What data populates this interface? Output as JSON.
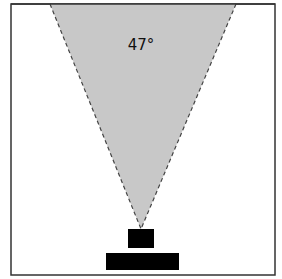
{
  "diagram": {
    "angle_label": "47°",
    "colors": {
      "frame": "#333333",
      "cone_fill": "#c8c8c8",
      "cone_edge": "#444444",
      "blocks": "#000000",
      "background": "#ffffff"
    },
    "frame": {
      "x": 11,
      "y": 4,
      "width": 264,
      "height": 271
    },
    "cone": {
      "top_left": [
        50,
        4
      ],
      "top_right": [
        236,
        4
      ],
      "apex": [
        141,
        229
      ]
    },
    "blocks": [
      {
        "name": "upper-block",
        "x": 128,
        "y": 229,
        "width": 26,
        "height": 19
      },
      {
        "name": "base-block",
        "x": 106,
        "y": 253,
        "width": 73,
        "height": 17
      }
    ]
  }
}
